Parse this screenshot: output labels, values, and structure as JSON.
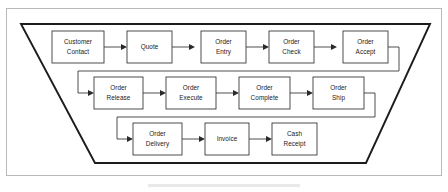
{
  "figure": {
    "frame": {
      "border_color": "#b9b9b9"
    },
    "container_shape": {
      "name": "trapezoid",
      "stroke_color": "#1c1c1c",
      "description": "Funnel-shaped trapezoid enclosing the process flow"
    },
    "box_style": {
      "fill": "#ffffff",
      "stroke": "#3a3a3a",
      "text_color": "#1a1a1a"
    }
  },
  "rows": [
    {
      "id": "row-1",
      "nodes": [
        {
          "id": "customer-contact",
          "line1": "Customer",
          "line2": "Contact"
        },
        {
          "id": "quote",
          "line1": "Quote",
          "line2": ""
        },
        {
          "id": "order-entry",
          "line1": "Order",
          "line2": "Entry"
        },
        {
          "id": "order-check",
          "line1": "Order",
          "line2": "Check"
        },
        {
          "id": "order-accept",
          "line1": "Order",
          "line2": "Accept"
        }
      ]
    },
    {
      "id": "row-2",
      "nodes": [
        {
          "id": "order-release",
          "line1": "Order",
          "line2": "Release"
        },
        {
          "id": "order-execute",
          "line1": "Order",
          "line2": "Execute"
        },
        {
          "id": "order-complete",
          "line1": "Order",
          "line2": "Complete"
        },
        {
          "id": "order-ship",
          "line1": "Order",
          "line2": "Ship"
        }
      ]
    },
    {
      "id": "row-3",
      "nodes": [
        {
          "id": "order-delivery",
          "line1": "Order",
          "line2": "Delivery"
        },
        {
          "id": "invoice",
          "line1": "Invoice",
          "line2": ""
        },
        {
          "id": "cash-receipt",
          "line1": "Cash",
          "line2": "Receipt"
        }
      ]
    }
  ],
  "connectors": [
    {
      "id": "customer-contact-to-quote",
      "from": "customer-contact",
      "to": "quote",
      "type": "straight-arrow"
    },
    {
      "id": "quote-to-order-entry",
      "from": "quote",
      "to": "order-entry",
      "type": "straight-arrow"
    },
    {
      "id": "order-entry-to-order-check",
      "from": "order-entry",
      "to": "order-check",
      "type": "straight-arrow"
    },
    {
      "id": "order-check-to-order-accept",
      "from": "order-check",
      "to": "order-accept",
      "type": "straight-arrow"
    },
    {
      "id": "order-accept-to-order-release",
      "from": "order-accept",
      "to": "order-release",
      "type": "wrap-around"
    },
    {
      "id": "order-release-to-order-execute",
      "from": "order-release",
      "to": "order-execute",
      "type": "straight-arrow"
    },
    {
      "id": "order-execute-to-order-complete",
      "from": "order-execute",
      "to": "order-complete",
      "type": "straight-arrow"
    },
    {
      "id": "order-complete-to-order-ship",
      "from": "order-complete",
      "to": "order-ship",
      "type": "straight-arrow"
    },
    {
      "id": "order-ship-to-order-delivery",
      "from": "order-ship",
      "to": "order-delivery",
      "type": "wrap-around"
    },
    {
      "id": "order-delivery-to-invoice",
      "from": "order-delivery",
      "to": "invoice",
      "type": "straight-arrow"
    },
    {
      "id": "invoice-to-cash-receipt",
      "from": "invoice",
      "to": "cash-receipt",
      "type": "straight-arrow"
    }
  ]
}
